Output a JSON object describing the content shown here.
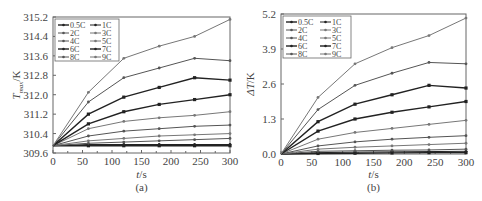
{
  "figure": {
    "panels": [
      {
        "id": "a",
        "caption": "(a)"
      },
      {
        "id": "b",
        "caption": "(b)"
      }
    ]
  },
  "chart_data": [
    {
      "type": "line",
      "panel": "(a)",
      "title": "",
      "xlabel": "t/s",
      "ylabel": "T_max/K",
      "ylabel_main": "T",
      "ylabel_sub": "max",
      "ylabel_unit": "/K",
      "xlim": [
        0,
        300
      ],
      "ylim": [
        309.6,
        315.2
      ],
      "xticks": [
        0,
        50,
        100,
        150,
        200,
        250,
        300
      ],
      "xtick_labels": [
        "0",
        "50",
        "100",
        "150",
        "200",
        "250",
        "300"
      ],
      "yticks": [
        309.6,
        310.4,
        311.2,
        312.0,
        312.8,
        313.6,
        314.4,
        315.2
      ],
      "ytick_labels": [
        "309.6",
        "310.4",
        "311.2",
        "312.0",
        "312.8",
        "313.6",
        "314.4",
        "315.2"
      ],
      "grid": false,
      "legend_position": "upper left",
      "legend_columns": 2,
      "x": [
        0,
        60,
        120,
        180,
        240,
        300
      ],
      "series": [
        {
          "name": "0.5C",
          "values": [
            309.9,
            309.9,
            309.9,
            309.9,
            309.9,
            309.9
          ]
        },
        {
          "name": "1C",
          "values": [
            309.9,
            309.95,
            309.95,
            309.95,
            309.95,
            309.95
          ]
        },
        {
          "name": "2C",
          "values": [
            309.9,
            310.0,
            310.05,
            310.1,
            310.15,
            310.2
          ]
        },
        {
          "name": "3C",
          "values": [
            309.9,
            310.1,
            310.2,
            310.3,
            310.35,
            310.4
          ]
        },
        {
          "name": "4C",
          "values": [
            309.9,
            310.3,
            310.5,
            310.6,
            310.7,
            310.75
          ]
        },
        {
          "name": "5C",
          "values": [
            309.9,
            310.6,
            310.9,
            311.05,
            311.15,
            311.3
          ]
        },
        {
          "name": "6C",
          "values": [
            309.9,
            310.8,
            311.3,
            311.6,
            311.8,
            312.0
          ]
        },
        {
          "name": "7C",
          "values": [
            309.9,
            311.2,
            311.9,
            312.3,
            312.7,
            312.6
          ]
        },
        {
          "name": "8C",
          "values": [
            309.9,
            311.7,
            312.7,
            313.1,
            313.5,
            313.4
          ]
        },
        {
          "name": "9C",
          "values": [
            309.9,
            312.1,
            313.5,
            314.0,
            314.4,
            315.1
          ]
        }
      ]
    },
    {
      "type": "line",
      "panel": "(b)",
      "title": "",
      "xlabel": "t/s",
      "ylabel": "ΔT/K",
      "xlim": [
        0,
        300
      ],
      "ylim": [
        0.0,
        5.2
      ],
      "xticks": [
        0,
        50,
        100,
        150,
        200,
        250,
        300
      ],
      "xtick_labels": [
        "0",
        "50",
        "100",
        "150",
        "200",
        "250",
        "300"
      ],
      "yticks": [
        0.0,
        1.3,
        2.6,
        3.9,
        5.2
      ],
      "ytick_labels": [
        "0.0",
        "1.3",
        "2.6",
        "3.9",
        "5.2"
      ],
      "grid": false,
      "legend_position": "upper left",
      "legend_columns": 2,
      "x": [
        0,
        60,
        120,
        180,
        240,
        300
      ],
      "series": [
        {
          "name": "0.5C",
          "values": [
            0,
            0.02,
            0.03,
            0.04,
            0.05,
            0.05
          ]
        },
        {
          "name": "1C",
          "values": [
            0,
            0.05,
            0.07,
            0.08,
            0.09,
            0.1
          ]
        },
        {
          "name": "2C",
          "values": [
            0,
            0.1,
            0.12,
            0.14,
            0.15,
            0.18
          ]
        },
        {
          "name": "3C",
          "values": [
            0,
            0.18,
            0.25,
            0.3,
            0.35,
            0.4
          ]
        },
        {
          "name": "4C",
          "values": [
            0,
            0.3,
            0.45,
            0.55,
            0.62,
            0.68
          ]
        },
        {
          "name": "5C",
          "values": [
            0,
            0.55,
            0.8,
            0.95,
            1.1,
            1.25
          ]
        },
        {
          "name": "6C",
          "values": [
            0,
            0.85,
            1.3,
            1.55,
            1.75,
            1.95
          ]
        },
        {
          "name": "7C",
          "values": [
            0,
            1.2,
            1.85,
            2.2,
            2.55,
            2.45
          ]
        },
        {
          "name": "8C",
          "values": [
            0,
            1.65,
            2.55,
            3.0,
            3.4,
            3.35
          ]
        },
        {
          "name": "9C",
          "values": [
            0,
            2.1,
            3.35,
            3.95,
            4.4,
            5.05
          ]
        }
      ]
    }
  ]
}
